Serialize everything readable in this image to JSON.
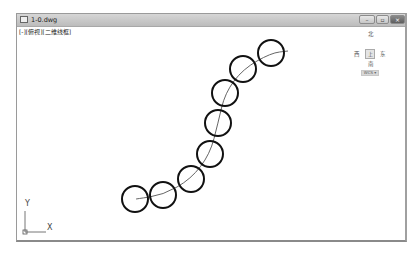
{
  "window": {
    "title": "1-0.dwg",
    "buttons": {
      "minimize": "–",
      "restore": "▫",
      "close": "×"
    }
  },
  "viewport": {
    "label": "[-][俯视][二维线框]"
  },
  "viewcube": {
    "north": "北",
    "south": "南",
    "east": "东",
    "west": "西",
    "face": "上",
    "wcs": "WCS ▾"
  },
  "ucs": {
    "x_label": "X",
    "y_label": "Y"
  },
  "drawing": {
    "circle_radius": 13,
    "circles": [
      {
        "cx": 135,
        "cy": 199
      },
      {
        "cx": 163,
        "cy": 195
      },
      {
        "cx": 191,
        "cy": 179
      },
      {
        "cx": 210,
        "cy": 154
      },
      {
        "cx": 218,
        "cy": 123
      },
      {
        "cx": 225,
        "cy": 93
      },
      {
        "cx": 243,
        "cy": 69
      },
      {
        "cx": 271,
        "cy": 53
      }
    ],
    "path_start": [
      136,
      199
    ],
    "path_end": [
      288,
      51
    ],
    "stroke_color": "#111111",
    "path_color": "#666666"
  }
}
